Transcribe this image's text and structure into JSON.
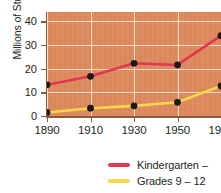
{
  "chart_data": {
    "type": "line",
    "title": "",
    "xlabel": "",
    "ylabel": "Millions of Students",
    "x": [
      1890,
      1910,
      1930,
      1950,
      1970
    ],
    "xtick_labels": [
      "1890",
      "1910",
      "1930",
      "1950",
      "1970"
    ],
    "ytick_labels": [
      "0",
      "10",
      "20",
      "30",
      "40"
    ],
    "yticks": [
      0,
      10,
      20,
      30,
      40
    ],
    "xlim": [
      1890,
      1970
    ],
    "ylim": [
      0,
      44
    ],
    "grid": true,
    "legend_position": "bottom-right",
    "plot_background": "#e08a5e",
    "series": [
      {
        "name": "Kindergarten –",
        "color": "#e0384e",
        "marker_color": "#1a1a1a",
        "values": [
          13.2,
          16.8,
          22.3,
          21.6,
          34.0
        ]
      },
      {
        "name": "Grades 9 – 12",
        "color": "#f5d84a",
        "marker_color": "#1a1a1a",
        "values": [
          1.5,
          3.3,
          4.3,
          5.8,
          12.7
        ]
      }
    ]
  },
  "axis": {
    "y_title": "Millions of Students"
  },
  "legend": {
    "items": [
      {
        "label": "Kindergarten –",
        "color": "#e0384e"
      },
      {
        "label": "Grades 9 – 12",
        "color": "#f5d84a"
      }
    ]
  }
}
